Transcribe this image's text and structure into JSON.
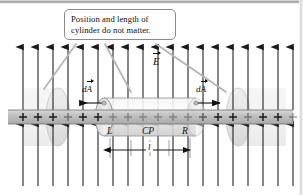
{
  "figure": {
    "name": "gauss-law-infinite-line-charge-cylinder",
    "background_color": "#ffffff"
  },
  "callout": {
    "line1": "Position and length of",
    "line2": "cylinder do not matter.",
    "border_color": "#8a8a8a",
    "fill_color": "#ffffff",
    "leader_count": 3
  },
  "labels": {
    "field_symbol": "E",
    "area_vector_symbol": "dA",
    "area_vector_left": "dA",
    "area_vector_right": "dA",
    "left_cap": "L",
    "curved_surface": "CP",
    "right_cap": "R",
    "length_symbol": "l"
  },
  "field": {
    "description": "uniform vertical electric field arrows",
    "arrow_color": "#1a1a1a",
    "top_arrow_count": 19,
    "bottom_arrow_count": 19,
    "top_direction": "up",
    "bottom_direction": "down"
  },
  "line_charge": {
    "description": "horizontal positively charged rod",
    "charge_symbol": "+",
    "rod_color": "#bdbdbd",
    "charge_count": 19
  },
  "cylinder": {
    "label": "gaussian-cylinder",
    "fill_color": "#e3e3e3",
    "edge_color": "#8f8f8f",
    "ghost_left_label": "ghost-cylinder-left",
    "ghost_right_label": "ghost-cylinder-right",
    "ghost_fill_color": "#d6d6d6"
  },
  "dimension": {
    "label": "length-dimension-line",
    "symbol": "l",
    "tick_count": 5
  }
}
